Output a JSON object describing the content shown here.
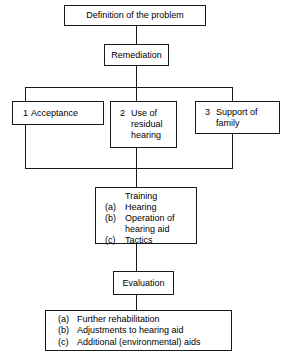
{
  "diagram": {
    "type": "flowchart",
    "line_color": "#1a1a1a",
    "background_color": "#ffffff",
    "nodes": {
      "definition": {
        "label": "Definition of the problem"
      },
      "remediation": {
        "label": "Remediation"
      },
      "acceptance": {
        "number": "1",
        "label": "Acceptance"
      },
      "residual": {
        "number": "2",
        "line1": "Use of",
        "line2": "residual",
        "line3": "hearing"
      },
      "support": {
        "number": "3",
        "line1": "Support of",
        "line2": "family"
      },
      "training": {
        "title": "Training",
        "items": [
          {
            "marker": "(a)",
            "text": "Hearing"
          },
          {
            "marker": "(b)",
            "text": "Operation of",
            "cont": "hearing aid"
          },
          {
            "marker": "(c)",
            "text": "Tactics"
          }
        ]
      },
      "evaluation": {
        "label": "Evaluation"
      },
      "outcomes": {
        "items": [
          {
            "marker": "(a)",
            "text": "Further rehabilitation"
          },
          {
            "marker": "(b)",
            "text": "Adjustments to hearing aid"
          },
          {
            "marker": "(c)",
            "text": "Additional (environmental) aids"
          }
        ]
      }
    }
  }
}
